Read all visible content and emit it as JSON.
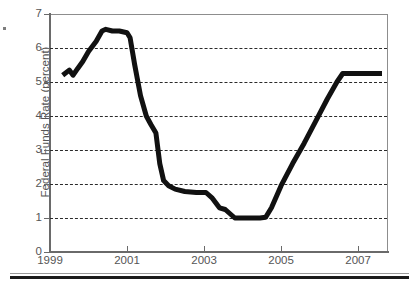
{
  "chart_data": {
    "type": "line",
    "title": "",
    "xlabel": "",
    "ylabel": "Federal Funds Rate (percent)",
    "xlim": [
      1999,
      2007.75
    ],
    "ylim": [
      0,
      7
    ],
    "grid": true,
    "legend": false,
    "y_ticks": [
      0,
      1,
      2,
      3,
      4,
      5,
      6,
      7
    ],
    "y_tick_labels": [
      "0",
      "1",
      "2",
      "3",
      "4",
      "5",
      "6",
      "7"
    ],
    "gridline_values": [
      1,
      2,
      3,
      4,
      5,
      6
    ],
    "x_ticks": [
      1999,
      2001,
      2003,
      2005,
      2007
    ],
    "x_tick_labels": [
      "1999",
      "2001",
      "2003",
      "2005",
      "2007"
    ],
    "line_color": "#111111",
    "line_width": 5,
    "series": [
      {
        "name": "Federal Funds Rate",
        "x": [
          1999.33,
          1999.5,
          1999.6,
          1999.72,
          1999.85,
          2000.0,
          2000.2,
          2000.35,
          2000.45,
          2000.62,
          2000.8,
          2001.0,
          2001.08,
          2001.2,
          2001.35,
          2001.5,
          2001.62,
          2001.75,
          2001.85,
          2001.95,
          2002.08,
          2002.25,
          2002.5,
          2002.8,
          2002.95,
          2003.05,
          2003.2,
          2003.4,
          2003.55,
          2003.8,
          2004.1,
          2004.45,
          2004.6,
          2004.75,
          2005.0,
          2005.3,
          2005.6,
          2005.9,
          2006.2,
          2006.45,
          2006.6,
          2006.8,
          2007.1,
          2007.4,
          2007.62
        ],
        "y": [
          5.2,
          5.35,
          5.2,
          5.4,
          5.6,
          5.9,
          6.2,
          6.5,
          6.55,
          6.5,
          6.5,
          6.45,
          6.3,
          5.5,
          4.6,
          4.0,
          3.75,
          3.5,
          2.6,
          2.1,
          1.95,
          1.85,
          1.78,
          1.75,
          1.75,
          1.75,
          1.6,
          1.3,
          1.25,
          1.0,
          1.0,
          1.0,
          1.02,
          1.3,
          1.95,
          2.6,
          3.2,
          3.85,
          4.5,
          5.0,
          5.25,
          5.25,
          5.25,
          5.25,
          5.25
        ]
      }
    ],
    "annotations": []
  },
  "figure": {
    "axis_title": "Federal Funds Rate (percent)"
  }
}
